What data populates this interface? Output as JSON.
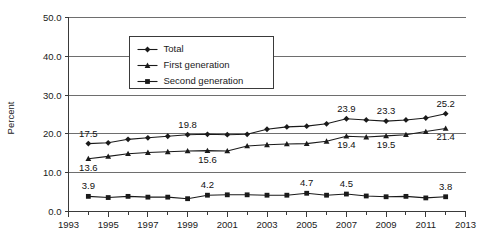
{
  "chart_data": {
    "type": "line",
    "title": "",
    "xlabel": "",
    "ylabel": "Percent",
    "xlim": [
      1993,
      2013
    ],
    "ylim": [
      0.0,
      50.0
    ],
    "grid": true,
    "legend_position": "top-center",
    "x": [
      1994,
      1995,
      1996,
      1997,
      1998,
      1999,
      2000,
      2001,
      2002,
      2003,
      2004,
      2005,
      2006,
      2007,
      2008,
      2009,
      2010,
      2011,
      2012
    ],
    "y_ticks": [
      "0.0",
      "10.0",
      "20.0",
      "30.0",
      "40.0",
      "50.0"
    ],
    "y_tick_values": [
      0.0,
      10.0,
      20.0,
      30.0,
      40.0,
      50.0
    ],
    "x_ticks": [
      "1993",
      "1995",
      "1997",
      "1999",
      "2001",
      "2003",
      "2005",
      "2007",
      "2009",
      "2011",
      "2013"
    ],
    "x_tick_values": [
      1993,
      1995,
      1997,
      1999,
      2001,
      2003,
      2005,
      2007,
      2009,
      2011,
      2013
    ],
    "series": [
      {
        "name": "Total",
        "marker": "diamond",
        "values": [
          17.5,
          17.7,
          18.6,
          19.0,
          19.4,
          19.8,
          19.9,
          19.8,
          19.9,
          21.2,
          21.8,
          22.0,
          22.6,
          23.9,
          23.6,
          23.3,
          23.6,
          24.1,
          25.2
        ],
        "labels": [
          {
            "x": 1994,
            "value": 17.5,
            "text": "17.5"
          },
          {
            "x": 1999,
            "value": 19.8,
            "text": "19.8"
          },
          {
            "x": 2007,
            "value": 23.9,
            "text": "23.9"
          },
          {
            "x": 2009,
            "value": 23.3,
            "text": "23.3"
          },
          {
            "x": 2012,
            "value": 25.2,
            "text": "25.2"
          }
        ]
      },
      {
        "name": "First generation",
        "marker": "triangle",
        "values": [
          13.6,
          14.2,
          14.9,
          15.2,
          15.4,
          15.6,
          15.7,
          15.6,
          16.9,
          17.2,
          17.4,
          17.5,
          18.1,
          19.4,
          19.2,
          19.5,
          19.8,
          20.6,
          21.4
        ],
        "labels": [
          {
            "x": 1994,
            "value": 13.6,
            "text": "13.6"
          },
          {
            "x": 2000,
            "value": 15.6,
            "text": "15.6"
          },
          {
            "x": 2007,
            "value": 19.4,
            "text": "19.4"
          },
          {
            "x": 2009,
            "value": 19.5,
            "text": "19.5"
          },
          {
            "x": 2012,
            "value": 21.4,
            "text": "21.4"
          }
        ]
      },
      {
        "name": "Second generation",
        "marker": "square",
        "values": [
          3.9,
          3.6,
          3.9,
          3.7,
          3.7,
          3.3,
          4.2,
          4.3,
          4.3,
          4.2,
          4.2,
          4.7,
          4.2,
          4.5,
          4.0,
          3.8,
          3.9,
          3.5,
          3.8
        ],
        "labels": [
          {
            "x": 1994,
            "value": 3.9,
            "text": "3.9"
          },
          {
            "x": 2000,
            "value": 4.2,
            "text": "4.2"
          },
          {
            "x": 2005,
            "value": 4.7,
            "text": "4.7"
          },
          {
            "x": 2007,
            "value": 4.5,
            "text": "4.5"
          },
          {
            "x": 2012,
            "value": 3.8,
            "text": "3.8"
          }
        ]
      }
    ]
  },
  "legend": {
    "items": [
      {
        "label": "Total"
      },
      {
        "label": "First generation"
      },
      {
        "label": "Second generation"
      }
    ]
  }
}
